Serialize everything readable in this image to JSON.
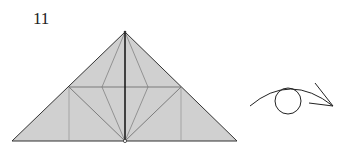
{
  "diagram": {
    "step_number": "11",
    "colors": {
      "paper_fill": "#d0d0d0",
      "edge": "#333333",
      "crease": "#707070",
      "center_line": "#111111"
    },
    "symbols": [
      "triangle-model",
      "turn-over-eye-arrow"
    ]
  }
}
